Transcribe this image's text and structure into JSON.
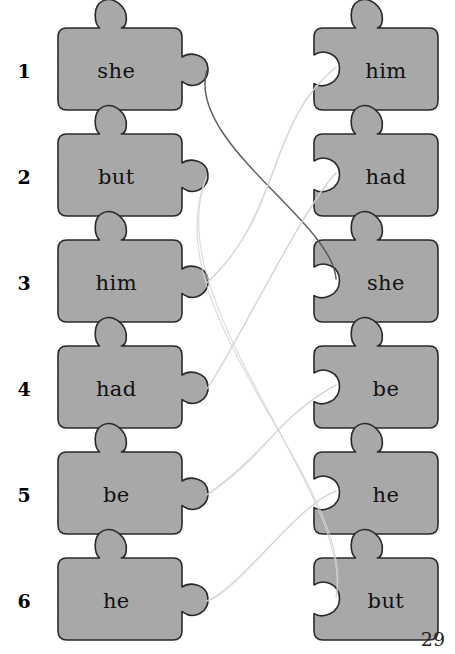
{
  "page": {
    "page_number": "29",
    "background_color": "#ffffff",
    "piece_fill_color": "#a8a8a8",
    "piece_stroke_color": "#2a2a2a",
    "text_color": "#111111"
  },
  "rows": [
    {
      "number": "1",
      "left_word": "she",
      "right_word": "him"
    },
    {
      "number": "2",
      "left_word": "but",
      "right_word": "had"
    },
    {
      "number": "3",
      "left_word": "him",
      "right_word": "she"
    },
    {
      "number": "4",
      "left_word": "had",
      "right_word": "be"
    },
    {
      "number": "5",
      "left_word": "be",
      "right_word": "he"
    },
    {
      "number": "6",
      "left_word": "he",
      "right_word": "but"
    }
  ],
  "connections": [
    {
      "from_row": 1,
      "to_row": 3,
      "word": "she",
      "style": "dark"
    },
    {
      "from_row": 2,
      "to_row": 6,
      "word": "but",
      "style": "faint"
    },
    {
      "from_row": 3,
      "to_row": 1,
      "word": "him",
      "style": "faint"
    },
    {
      "from_row": 4,
      "to_row": 2,
      "word": "had",
      "style": "faint"
    },
    {
      "from_row": 5,
      "to_row": 4,
      "word": "be",
      "style": "faint"
    },
    {
      "from_row": 6,
      "to_row": 5,
      "word": "he",
      "style": "faint"
    }
  ],
  "geometry": {
    "left_piece_x": 58,
    "right_piece_x": 314,
    "piece_width": 124,
    "piece_height": 82,
    "row_tops": [
      28,
      134,
      240,
      346,
      452,
      558
    ],
    "number_x": 24
  }
}
